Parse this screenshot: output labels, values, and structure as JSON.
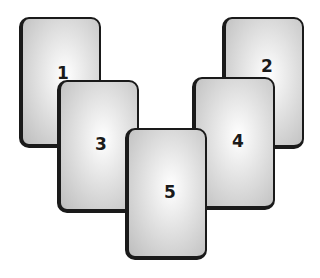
{
  "diagram": {
    "cards": [
      {
        "label": "1",
        "x": 19,
        "y": 17,
        "w": 82,
        "h": 131,
        "num_x": 40,
        "num_y": 54,
        "z": 1
      },
      {
        "label": "2",
        "x": 222,
        "y": 17,
        "w": 82,
        "h": 132,
        "num_x": 41,
        "num_y": 47,
        "z": 1
      },
      {
        "label": "3",
        "x": 57,
        "y": 80,
        "w": 82,
        "h": 133,
        "num_x": 40,
        "num_y": 62,
        "z": 2
      },
      {
        "label": "4",
        "x": 192,
        "y": 77,
        "w": 83,
        "h": 133,
        "num_x": 42,
        "num_y": 62,
        "z": 2
      },
      {
        "label": "5",
        "x": 125,
        "y": 128,
        "w": 82,
        "h": 132,
        "num_x": 41,
        "num_y": 62,
        "z": 3
      }
    ],
    "colors": {
      "border": "#1a1a1a",
      "card_center": "#ffffff",
      "card_edge": "#bdbdbd",
      "background": "#ffffff"
    }
  }
}
